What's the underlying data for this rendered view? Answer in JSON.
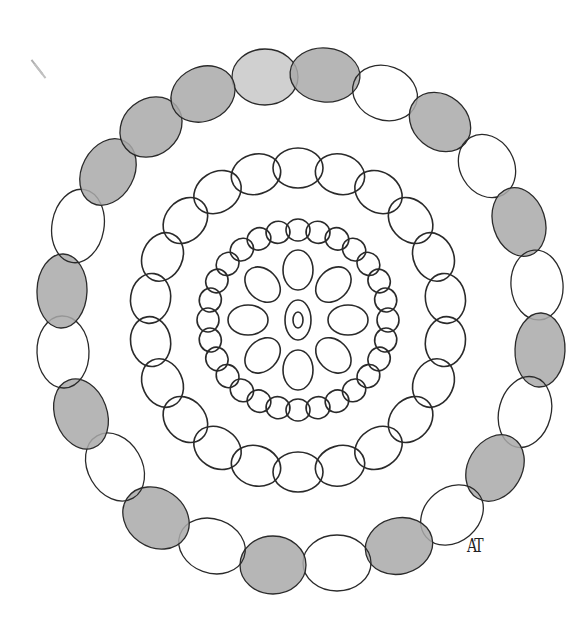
{
  "artwork": {
    "type": "hand-drawn mandala",
    "signature": "AT",
    "center": [
      298,
      320
    ],
    "stroke_color": "#2a2a2a",
    "shade_color": "#a9a9a9",
    "light_shade_color": "#c8c8c8",
    "outer_ring": {
      "count": 24,
      "ovals": [
        {
          "cx": 265,
          "cy": 77,
          "rx": 33,
          "ry": 28,
          "angle": 0,
          "fill": "light"
        },
        {
          "cx": 325,
          "cy": 75,
          "rx": 35,
          "ry": 27,
          "angle": 5,
          "fill": "shaded"
        },
        {
          "cx": 385,
          "cy": 93,
          "rx": 33,
          "ry": 27,
          "angle": 20,
          "fill": "none"
        },
        {
          "cx": 440,
          "cy": 122,
          "rx": 33,
          "ry": 27,
          "angle": 40,
          "fill": "shaded"
        },
        {
          "cx": 487,
          "cy": 166,
          "rx": 33,
          "ry": 27,
          "angle": 60,
          "fill": "none"
        },
        {
          "cx": 519,
          "cy": 222,
          "rx": 35,
          "ry": 26,
          "angle": 72,
          "fill": "shaded"
        },
        {
          "cx": 537,
          "cy": 285,
          "rx": 35,
          "ry": 26,
          "angle": 85,
          "fill": "none"
        },
        {
          "cx": 540,
          "cy": 350,
          "rx": 37,
          "ry": 25,
          "angle": 92,
          "fill": "shaded"
        },
        {
          "cx": 525,
          "cy": 412,
          "rx": 36,
          "ry": 26,
          "angle": 105,
          "fill": "none"
        },
        {
          "cx": 495,
          "cy": 468,
          "rx": 35,
          "ry": 27,
          "angle": 120,
          "fill": "shaded"
        },
        {
          "cx": 452,
          "cy": 515,
          "rx": 34,
          "ry": 27,
          "angle": 140,
          "fill": "none"
        },
        {
          "cx": 399,
          "cy": 546,
          "rx": 34,
          "ry": 28,
          "angle": 165,
          "fill": "shaded"
        },
        {
          "cx": 337,
          "cy": 563,
          "rx": 34,
          "ry": 28,
          "angle": 180,
          "fill": "none"
        },
        {
          "cx": 273,
          "cy": 565,
          "rx": 33,
          "ry": 29,
          "angle": 180,
          "fill": "shaded"
        },
        {
          "cx": 212,
          "cy": 546,
          "rx": 34,
          "ry": 27,
          "angle": 20,
          "fill": "none"
        },
        {
          "cx": 156,
          "cy": 518,
          "rx": 35,
          "ry": 29,
          "angle": 35,
          "fill": "shaded"
        },
        {
          "cx": 115,
          "cy": 467,
          "rx": 36,
          "ry": 27,
          "angle": 60,
          "fill": "none"
        },
        {
          "cx": 81,
          "cy": 414,
          "rx": 36,
          "ry": 26,
          "angle": 70,
          "fill": "shaded"
        },
        {
          "cx": 63,
          "cy": 352,
          "rx": 36,
          "ry": 26,
          "angle": 88,
          "fill": "none"
        },
        {
          "cx": 62,
          "cy": 291,
          "rx": 37,
          "ry": 25,
          "angle": 92,
          "fill": "shaded"
        },
        {
          "cx": 78,
          "cy": 226,
          "rx": 37,
          "ry": 26,
          "angle": 100,
          "fill": "none"
        },
        {
          "cx": 108,
          "cy": 172,
          "rx": 35,
          "ry": 26,
          "angle": 118,
          "fill": "shaded"
        },
        {
          "cx": 151,
          "cy": 127,
          "rx": 33,
          "ry": 28,
          "angle": 140,
          "fill": "shaded"
        },
        {
          "cx": 203,
          "cy": 94,
          "rx": 33,
          "ry": 27,
          "angle": 155,
          "fill": "shaded"
        }
      ]
    },
    "middle_ring": {
      "count": 22,
      "radius": 152,
      "rx": 25,
      "ry": 20,
      "fill": "none"
    },
    "inner_ring": {
      "count": 28,
      "radius": 90,
      "rx": 12,
      "ry": 11,
      "fill": "none"
    },
    "petals": {
      "count": 8,
      "radius": 50,
      "rx": 15,
      "ry": 20,
      "fill": "none"
    },
    "center_oval": {
      "rx": 13,
      "ry": 20,
      "inner_rx": 5,
      "inner_ry": 8
    }
  }
}
